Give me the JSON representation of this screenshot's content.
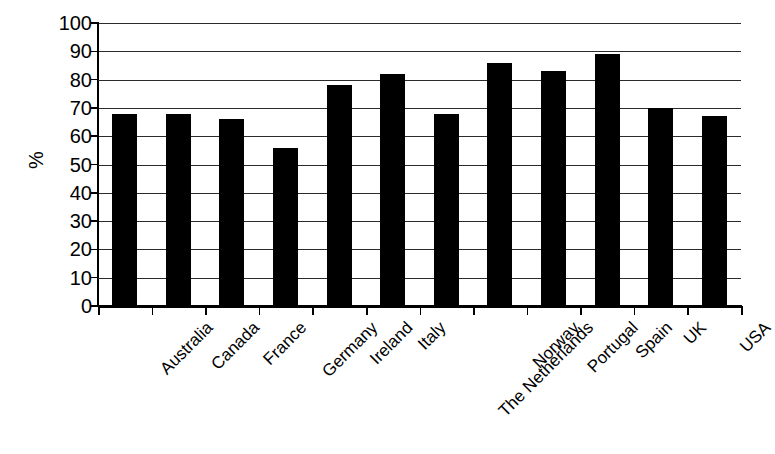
{
  "chart_data": {
    "type": "bar",
    "title": "",
    "subtitle": "",
    "xlabel": "",
    "ylabel": "%",
    "ylim": [
      0,
      100
    ],
    "ytick_step": 10,
    "grid": true,
    "legend": false,
    "legend_position": "none",
    "bar_color": "#000000",
    "grid_color": "#2b2b2b",
    "axis_color": "#000000",
    "categories": [
      "Australia",
      "Canada",
      "France",
      "Germany",
      "Ireland",
      "Italy",
      "The Netherlands",
      "Norway",
      "Portugal",
      "Spain",
      "UK",
      "USA"
    ],
    "values": [
      68,
      68,
      66,
      56,
      78,
      82,
      68,
      86,
      83,
      89,
      70,
      67
    ],
    "ytick_labels": [
      "100",
      "90",
      "80",
      "70",
      "60",
      "50",
      "40",
      "30",
      "20",
      "10",
      "0"
    ],
    "ytick_values": [
      100,
      90,
      80,
      70,
      60,
      50,
      40,
      30,
      20,
      10,
      0
    ]
  }
}
